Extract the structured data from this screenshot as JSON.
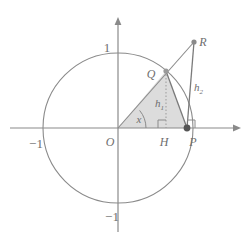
{
  "figure": {
    "kind": "unit-circle-trigonometry-diagram",
    "background_color": "#ffffff",
    "stroke_color": "#7f7f7f",
    "light_stroke_color": "#9a9a9a",
    "fill_color": "#dcdcdc",
    "label_color": "#6e6e6e",
    "width": 250,
    "height": 243
  },
  "axes": {
    "origin": {
      "x": 118,
      "y": 128
    },
    "unit_px": 75,
    "x_axis": {
      "from_x": 10,
      "to_x": 241,
      "y": 128,
      "arrow": "right"
    },
    "y_axis": {
      "x": 118,
      "from_y": 232,
      "to_y": 17,
      "arrow": "up"
    },
    "tick_labels": [
      {
        "name": "y-top-label",
        "text": "1",
        "x": 114,
        "y": 48
      },
      {
        "name": "x-left-label",
        "text": "−1",
        "x": 35,
        "y": 144
      },
      {
        "name": "y-bottom-label",
        "text": "−1",
        "x": 111,
        "y": 219
      }
    ]
  },
  "circle": {
    "cx": 118,
    "cy": 128,
    "r": 75,
    "label": "unit circle"
  },
  "points": [
    {
      "id": "O",
      "label": "O",
      "x": 118,
      "y": 128,
      "label_x": 110,
      "label_y": 142,
      "dot": false
    },
    {
      "id": "Q",
      "label": "Q",
      "x": 166,
      "y": 71,
      "label_x": 150,
      "label_y": 76,
      "dot": true
    },
    {
      "id": "H",
      "label": "H",
      "x": 166,
      "y": 128,
      "label_x": 162,
      "label_y": 142,
      "dot": false
    },
    {
      "id": "P",
      "label": "P",
      "x": 187,
      "y": 128,
      "label_x": 191,
      "label_y": 142,
      "dot": true
    },
    {
      "id": "R",
      "label": "R",
      "x": 194,
      "y": 42,
      "label_x": 200,
      "label_y": 42,
      "dot": true
    }
  ],
  "segments": [
    {
      "name": "ray-O-to-R",
      "from": "O",
      "to": "R",
      "style": "solid"
    },
    {
      "name": "segment-O-to-P",
      "from": "O",
      "to": "P",
      "style": "solid"
    },
    {
      "name": "segment-Q-to-P",
      "from": "Q",
      "to": "P",
      "style": "solid"
    },
    {
      "name": "segment-P-to-R",
      "from": "P",
      "to": "R",
      "style": "solid"
    },
    {
      "name": "segment-Q-to-H",
      "from": "Q",
      "to": "H",
      "style": "dotted"
    }
  ],
  "shaded_region": {
    "name": "triangle-OQP",
    "vertices": [
      "O",
      "Q",
      "P"
    ],
    "fill": "#dcdcdc"
  },
  "angle": {
    "name": "angle-at-origin",
    "label": "x",
    "label_x": 138,
    "label_y": 121,
    "vertex": "O",
    "degrees": 50
  },
  "measure_labels": [
    {
      "name": "h1-label",
      "base": "h",
      "subscript": "1",
      "x": 158,
      "y": 104,
      "describes": "QH"
    },
    {
      "name": "h2-label",
      "base": "h",
      "subscript": "2",
      "x": 197,
      "y": 88,
      "describes": "PR"
    }
  ],
  "right_angle_marks": [
    {
      "name": "right-angle-at-H",
      "x": 166,
      "y": 128,
      "dir_x": -1,
      "dir_y": -1,
      "size": 8
    },
    {
      "name": "right-angle-at-P",
      "x": 187,
      "y": 128,
      "dir_x": 1,
      "dir_y": -1,
      "size": 8
    }
  ]
}
